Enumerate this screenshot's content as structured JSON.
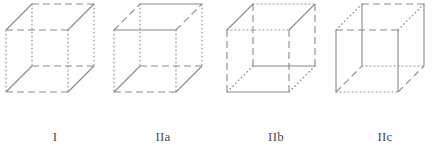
{
  "panel": {
    "width": 440,
    "height": 168,
    "background": "#ffffff",
    "line_color": "#8a8a8a",
    "label_color": "#4a4a4a",
    "stroke_width": 1.1
  },
  "geometry": {
    "description": "isometric wireframe cube, oblique projection",
    "front_left_x": 6,
    "front_top_y": 30,
    "face_width": 62,
    "face_height": 62,
    "depth_dx": 26,
    "depth_dy": -26
  },
  "line_styles": {
    "solid": "none",
    "dashed": "7,4",
    "dotted": "1,3"
  },
  "figures": [
    {
      "id": "I",
      "label": "I",
      "edges": {
        "front_top": "dashed",
        "front_bottom": "dashed",
        "back_top": "dashed",
        "back_bottom": "dashed",
        "front_left_vertical": "dotted",
        "front_right_vertical": "dotted",
        "back_left_vertical": "dotted",
        "back_right_vertical": "dotted",
        "top_left_diagonal": "solid",
        "top_right_diagonal": "solid",
        "bottom_left_diagonal": "solid",
        "bottom_right_diagonal": "solid"
      }
    },
    {
      "id": "IIa",
      "label": "IIa",
      "edges": {
        "front_top": "solid",
        "front_bottom": "dashed",
        "back_top": "solid",
        "back_bottom": "dashed",
        "front_left_vertical": "dotted",
        "front_right_vertical": "dotted",
        "back_left_vertical": "dotted",
        "back_right_vertical": "dotted",
        "top_left_diagonal": "dashed",
        "top_right_diagonal": "dashed",
        "bottom_left_diagonal": "solid",
        "bottom_right_diagonal": "solid"
      }
    },
    {
      "id": "IIb",
      "label": "IIb",
      "edges": {
        "front_top": "dotted",
        "front_bottom": "solid",
        "back_top": "dotted",
        "back_bottom": "solid",
        "front_left_vertical": "dashed",
        "front_right_vertical": "dashed",
        "back_left_vertical": "dashed",
        "back_right_vertical": "dashed",
        "top_left_diagonal": "solid",
        "top_right_diagonal": "solid",
        "bottom_left_diagonal": "dotted",
        "bottom_right_diagonal": "dotted"
      }
    },
    {
      "id": "IIc",
      "label": "IIc",
      "edges": {
        "front_top": "dashed",
        "front_bottom": "dotted",
        "back_top": "dashed",
        "back_bottom": "dotted",
        "front_left_vertical": "solid",
        "front_right_vertical": "solid",
        "back_left_vertical": "solid",
        "back_right_vertical": "solid",
        "top_left_diagonal": "dotted",
        "top_right_diagonal": "dotted",
        "bottom_left_diagonal": "dashed",
        "bottom_right_diagonal": "dashed"
      }
    }
  ]
}
